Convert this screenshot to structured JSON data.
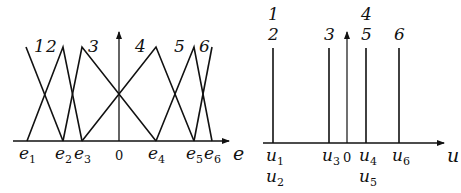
{
  "left_diagram": {
    "axis_label": "e",
    "origin_label": "0",
    "tick_labels": [
      {
        "base": "e",
        "sub": "1",
        "x": 27
      },
      {
        "base": "e",
        "sub": "2",
        "x": 63
      },
      {
        "base": "e",
        "sub": "3",
        "x": 82
      },
      {
        "base": "e",
        "sub": "4",
        "x": 156
      },
      {
        "base": "e",
        "sub": "5",
        "x": 194
      },
      {
        "base": "e",
        "sub": "6",
        "x": 212
      }
    ],
    "membership_functions": [
      {
        "id": "1",
        "points": [
          [
            26,
            47
          ],
          [
            63,
            141
          ]
        ]
      },
      {
        "id": "2",
        "points": [
          [
            27,
            141
          ],
          [
            63,
            47
          ],
          [
            82,
            141
          ]
        ]
      },
      {
        "id": "3",
        "points": [
          [
            63,
            141
          ],
          [
            82,
            47
          ],
          [
            156,
            141
          ]
        ]
      },
      {
        "id": "4",
        "points": [
          [
            82,
            141
          ],
          [
            156,
            47
          ],
          [
            194,
            141
          ]
        ]
      },
      {
        "id": "5",
        "points": [
          [
            156,
            141
          ],
          [
            194,
            47
          ],
          [
            212,
            141
          ]
        ]
      },
      {
        "id": "6",
        "points": [
          [
            194,
            141
          ],
          [
            212,
            47
          ]
        ]
      }
    ],
    "function_labels": [
      "1",
      "2",
      "3",
      "4",
      "5",
      "6"
    ]
  },
  "right_diagram": {
    "axis_label": "u",
    "origin_label": "0",
    "singletons": [
      {
        "x": 273,
        "labels_top": [
          "1",
          "2"
        ],
        "labels_bottom": [
          {
            "base": "u",
            "sub": "1"
          },
          {
            "base": "u",
            "sub": "2"
          }
        ]
      },
      {
        "x": 329,
        "labels_top": [
          "3"
        ],
        "labels_bottom": [
          {
            "base": "u",
            "sub": "3"
          }
        ]
      },
      {
        "x": 366,
        "labels_top": [
          "4",
          "5"
        ],
        "labels_bottom": [
          {
            "base": "u",
            "sub": "4"
          },
          {
            "base": "u",
            "sub": "5"
          }
        ]
      },
      {
        "x": 399,
        "labels_top": [
          "6"
        ],
        "labels_bottom": [
          {
            "base": "u",
            "sub": "6"
          }
        ]
      }
    ]
  }
}
